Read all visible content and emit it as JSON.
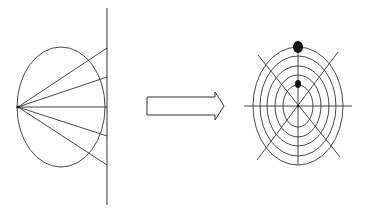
{
  "diagram": {
    "colors": {
      "line": "#333333",
      "dot": "#111111",
      "background": "#ffffff"
    },
    "left_panel": {
      "plane_line": {
        "x": 107,
        "y1": 8,
        "y2": 205
      },
      "ellipse": {
        "cx": 61,
        "cy": 107,
        "rx": 44,
        "ry": 60
      },
      "apex": {
        "x": 18,
        "y": 107
      },
      "ray_endpoints_y": [
        48,
        77,
        107,
        136,
        165
      ]
    },
    "arrow": {
      "x": 147,
      "y": 97,
      "body_width": 68,
      "body_height": 18,
      "head_width": 9,
      "head_height": 28,
      "direction": "right"
    },
    "right_panel": {
      "center": {
        "x": 298,
        "y": 106
      },
      "rings": [
        {
          "rx": 15,
          "ry": 21
        },
        {
          "rx": 23,
          "ry": 31
        },
        {
          "rx": 31,
          "ry": 40
        },
        {
          "rx": 38,
          "ry": 50
        },
        {
          "rx": 45,
          "ry": 59
        }
      ],
      "horizontal_axis": {
        "x1": 244,
        "x2": 352
      },
      "vertical_axis": {
        "y1": 47,
        "y2": 165
      },
      "diagonals": [
        {
          "x1": 258,
          "y1": 55,
          "x2": 340,
          "y2": 157
        },
        {
          "x1": 338,
          "y1": 52,
          "x2": 257,
          "y2": 160
        }
      ],
      "dots": [
        {
          "cx": 298,
          "cy": 47,
          "rx": 5,
          "ry": 6,
          "label": "outer-point"
        },
        {
          "cx": 298,
          "cy": 84,
          "rx": 3,
          "ry": 4,
          "label": "inner-point"
        }
      ]
    }
  }
}
